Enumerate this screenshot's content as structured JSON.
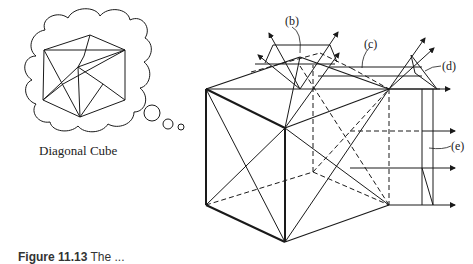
{
  "thought_bubble": {
    "label": "Diagonal Cube"
  },
  "callouts": {
    "b": "(b)",
    "c": "(c)",
    "d": "(d)",
    "e": "(e)"
  },
  "caption": {
    "figure_number": "Figure 11.13",
    "text": "The ..."
  },
  "colors": {
    "line": "#1a1a1a",
    "background": "#ffffff"
  }
}
